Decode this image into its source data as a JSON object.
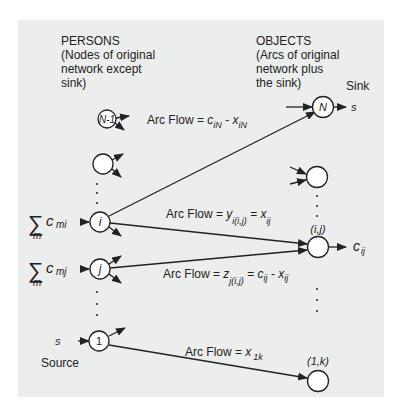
{
  "colors": {
    "background": "#ffffff",
    "panel": "#eceded",
    "stroke": "#222222",
    "node_fill": "#ffffff"
  },
  "left_header": {
    "title": "PERSONS",
    "line1": "(Nodes of original",
    "line2": "network except",
    "line3": "sink)"
  },
  "right_header": {
    "title": "OBJECTS",
    "line1": "(Arcs of original",
    "line2": "network plus",
    "line3": "the sink)"
  },
  "nodes": {
    "n_minus_1": "N-1",
    "i": "i",
    "j": "j",
    "one": "1",
    "N": "N",
    "ij_label": "(i,j)",
    "one_k_label": "(1,k)"
  },
  "sink": {
    "label": "Sink",
    "symbol": "s"
  },
  "source": {
    "label": "Source",
    "symbol": "s"
  },
  "supplies": {
    "i": {
      "sigma": "∑",
      "c": "c",
      "sub": "mi",
      "under": "m"
    },
    "j": {
      "sigma": "∑",
      "c": "c",
      "sub": "mj",
      "under": "m"
    }
  },
  "outflow_ij": {
    "c": "c",
    "sub": "ij"
  },
  "arc_labels": {
    "iN": {
      "prefix": "Arc Flow = ",
      "a": "c",
      "a_sub": "iN",
      "op": " - ",
      "b": "x",
      "b_sub": "iN"
    },
    "i_ij": {
      "prefix": "Arc Flow = ",
      "a": "y",
      "a_sub": "i(i,j)",
      "op": " = ",
      "b": "x",
      "b_sub": "ij"
    },
    "j_ij": {
      "prefix": "Arc Flow = ",
      "a": "z",
      "a_sub": "j(i,j)",
      "op": " = ",
      "b": "c",
      "b_sub": "ij",
      "op2": " - ",
      "c": "x",
      "c_sub": "ij"
    },
    "one_1k": {
      "prefix": "Arc Flow = ",
      "a": "x",
      "a_sub": "1k"
    }
  }
}
